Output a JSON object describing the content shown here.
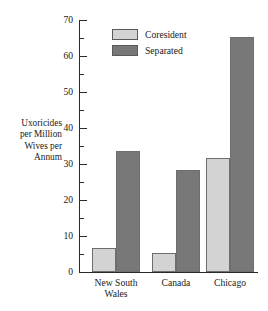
{
  "chart_data": {
    "type": "bar",
    "title": "",
    "xlabel": "",
    "ylabel": "Uxoricides per Million Wives per Annum",
    "ylabel_lines": [
      "Uxoricides",
      "per Million",
      "Wives per",
      "Annum"
    ],
    "categories": [
      "New South Wales",
      "Canada",
      "Chicago"
    ],
    "category_lines": [
      [
        "New South",
        "Wales"
      ],
      [
        "Canada"
      ],
      [
        "Chicago"
      ]
    ],
    "series": [
      {
        "name": "Coresident",
        "values": [
          6.7,
          5.3,
          31.7
        ],
        "color": "#d3d3d3"
      },
      {
        "name": "Separated",
        "values": [
          33.5,
          28.2,
          65.3
        ],
        "color": "#787878"
      }
    ],
    "ylim": [
      0,
      70
    ],
    "yticks": [
      0,
      10,
      20,
      30,
      40,
      50,
      60,
      70
    ],
    "ytick_labels": [
      "0",
      "10",
      "20",
      "30",
      "40",
      "50",
      "60",
      "70"
    ],
    "yminor_ticks": [
      5,
      15,
      25,
      35,
      45,
      55,
      65
    ],
    "grid": false,
    "legend_position": "top-left-inside",
    "legend_entries": [
      "Coresident",
      "Separated"
    ]
  }
}
